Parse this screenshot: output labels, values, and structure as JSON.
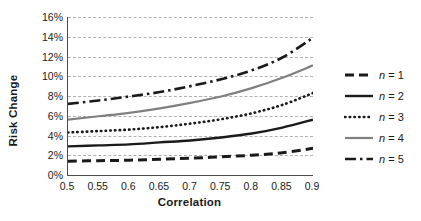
{
  "chart_data": {
    "type": "line",
    "title": "",
    "xlabel": "Correlation",
    "ylabel": "Risk Change",
    "xlim": [
      0.5,
      0.9
    ],
    "ylim": [
      0,
      16
    ],
    "xticks": [
      "0.5",
      "0.55",
      "0.6",
      "0.65",
      "0.7",
      "0.75",
      "0.8",
      "0.85",
      "0.9"
    ],
    "xtick_values": [
      0.5,
      0.55,
      0.6,
      0.65,
      0.7,
      0.75,
      0.8,
      0.85,
      0.9
    ],
    "yticks": [
      "0%",
      "2%",
      "4%",
      "6%",
      "8%",
      "10%",
      "12%",
      "14%",
      "16%"
    ],
    "ytick_values": [
      0,
      2,
      4,
      6,
      8,
      10,
      12,
      14,
      16
    ],
    "grid": "horizontal-dashed",
    "legend_position": "right",
    "x": [
      0.5,
      0.55,
      0.6,
      0.65,
      0.7,
      0.75,
      0.8,
      0.85,
      0.9
    ],
    "series": [
      {
        "name": "n = 1",
        "label_prefix": "n",
        "label_suffix": "= 1",
        "style": "dashed",
        "color": "#1a1a1a",
        "width": 3.0,
        "dash": "9,5",
        "values": [
          1.4,
          1.45,
          1.5,
          1.6,
          1.7,
          1.85,
          2.0,
          2.25,
          2.7
        ]
      },
      {
        "name": "n = 2",
        "label_prefix": "n",
        "label_suffix": "= 2",
        "style": "solid",
        "color": "#1a1a1a",
        "width": 2.4,
        "dash": "",
        "values": [
          2.9,
          3.0,
          3.1,
          3.3,
          3.5,
          3.8,
          4.2,
          4.8,
          5.6
        ]
      },
      {
        "name": "n = 3",
        "label_prefix": "n",
        "label_suffix": "= 3",
        "style": "dotted",
        "color": "#1a1a1a",
        "width": 2.6,
        "dash": "0.5,4.2",
        "values": [
          4.3,
          4.45,
          4.6,
          4.85,
          5.2,
          5.65,
          6.25,
          7.1,
          8.3
        ]
      },
      {
        "name": "n = 4",
        "label_prefix": "n",
        "label_suffix": "= 4",
        "style": "solid",
        "color": "#808080",
        "width": 2.2,
        "dash": "",
        "values": [
          5.6,
          5.95,
          6.3,
          6.75,
          7.3,
          7.95,
          8.8,
          9.85,
          11.1
        ]
      },
      {
        "name": "n = 5",
        "label_prefix": "n",
        "label_suffix": "= 5",
        "style": "dash-dot",
        "color": "#1a1a1a",
        "width": 2.6,
        "dash": "11,4,2.5,4",
        "values": [
          7.2,
          7.55,
          7.95,
          8.4,
          9.0,
          9.7,
          10.6,
          11.9,
          13.9
        ]
      }
    ]
  },
  "axes": {
    "ylabel": "Risk Change",
    "xlabel": "Correlation"
  },
  "legend": {
    "items": [
      {
        "label": "n = 1"
      },
      {
        "label": "n = 2"
      },
      {
        "label": "n = 3"
      },
      {
        "label": "n = 4"
      },
      {
        "label": "n = 5"
      }
    ]
  },
  "colors": {
    "axis": "#4d4d4d",
    "grid": "#b0b0b0",
    "text": "#1a1a1a",
    "series_black": "#1a1a1a",
    "series_gray": "#808080",
    "background": "#ffffff"
  }
}
